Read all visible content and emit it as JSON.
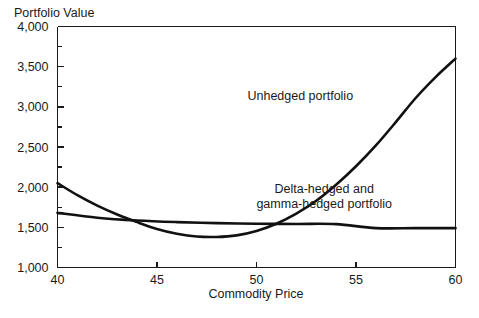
{
  "chart_data": {
    "type": "line",
    "title": "",
    "ylabel": "Portfolio Value",
    "xlabel": "Commodity Price",
    "xlim": [
      40,
      60
    ],
    "ylim": [
      1000,
      4000
    ],
    "xticks": [
      40,
      45,
      50,
      55,
      60
    ],
    "xtick_labels": [
      "40",
      "45",
      "50",
      "55",
      "60"
    ],
    "yticks": [
      1000,
      1500,
      2000,
      2500,
      3000,
      3500,
      4000
    ],
    "ytick_labels": [
      "1,000",
      "1,500",
      "2,000",
      "2,500",
      "3,000",
      "3,500",
      "4,000"
    ],
    "yminor_ticks": [
      1250,
      1750,
      2250,
      2750,
      3250,
      3750
    ],
    "grid": false,
    "legend_position": "inline-annotations",
    "series": [
      {
        "name": "Unhedged portfolio",
        "x": [
          40,
          41,
          42,
          43,
          44,
          45,
          46,
          47,
          48,
          49,
          50,
          51,
          52,
          53,
          54,
          55,
          56,
          57,
          58,
          59,
          60
        ],
        "values": [
          2050,
          1900,
          1770,
          1660,
          1565,
          1480,
          1420,
          1385,
          1380,
          1400,
          1455,
          1545,
          1670,
          1830,
          2030,
          2260,
          2520,
          2810,
          3110,
          3370,
          3600
        ]
      },
      {
        "name": "Delta-hedged and gamma-hedged portfolio",
        "x": [
          40,
          42,
          44,
          46,
          48,
          50,
          52,
          54,
          56,
          58,
          60
        ],
        "values": [
          1680,
          1620,
          1585,
          1565,
          1552,
          1545,
          1542,
          1540,
          1490,
          1490,
          1490
        ]
      }
    ],
    "annotations": [
      {
        "name": "unhedged-label",
        "lines": [
          "Unhedged portfolio"
        ],
        "x": 52.2,
        "y": 3080
      },
      {
        "name": "hedged-label",
        "lines": [
          "Delta-hedged and",
          "gamma-hedged portfolio"
        ],
        "x": 53.4,
        "y": 1930
      }
    ]
  }
}
